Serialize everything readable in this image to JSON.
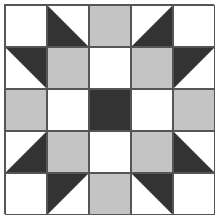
{
  "colors": {
    "white": "#ffffff",
    "gray": "#c4c4c4",
    "dark": "#333333",
    "line": "#555555"
  },
  "grid": {
    "rows": 5,
    "cols": 5,
    "cells": [
      [
        "white",
        "tri-dark-lower-left",
        "gray",
        "tri-dark-lower-right",
        "white"
      ],
      [
        "tri-dark-upper-right",
        "gray",
        "white",
        "gray",
        "tri-dark-upper-left"
      ],
      [
        "gray",
        "white",
        "dark",
        "white",
        "gray"
      ],
      [
        "tri-dark-lower-right",
        "gray",
        "white",
        "gray",
        "tri-dark-lower-left"
      ],
      [
        "white",
        "tri-dark-upper-left",
        "gray",
        "tri-dark-upper-right",
        "white"
      ]
    ]
  }
}
